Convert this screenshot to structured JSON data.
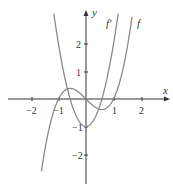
{
  "chart_data": {
    "type": "line",
    "title": "",
    "xlabel": "x",
    "ylabel": "y",
    "xlim": [
      -2.8,
      3.0
    ],
    "ylim": [
      -3.0,
      3.5
    ],
    "x_ticks": [
      -2,
      -1,
      1,
      2
    ],
    "y_ticks": [
      -2,
      -1,
      1,
      2
    ],
    "grid": false,
    "series": [
      {
        "name": "f",
        "formula": "x^3 - x",
        "x": [
          -1.6,
          -1,
          -0.577,
          0,
          0.577,
          1,
          1.65
        ],
        "values": [
          -2.5,
          0,
          0.385,
          0,
          -0.385,
          0,
          2.84
        ]
      },
      {
        "name": "f'",
        "formula": "3x^2 - 1",
        "x": [
          -1.15,
          -1,
          -0.577,
          0,
          0.577,
          1,
          1.15
        ],
        "values": [
          2.97,
          2,
          0,
          -1,
          0,
          2,
          2.97
        ]
      }
    ],
    "annotations": [
      "f'",
      "f"
    ]
  },
  "axes": {
    "x_label": "x",
    "y_label": "y",
    "x_tick_labels": [
      "−2",
      "−1",
      "1",
      "2"
    ],
    "y_tick_labels": [
      "2",
      "1",
      "−1",
      "−2"
    ]
  },
  "labels": {
    "f_prime": "f′",
    "f": "f"
  },
  "colors": {
    "curve": "#8a8a8a",
    "axis": "#333333"
  }
}
